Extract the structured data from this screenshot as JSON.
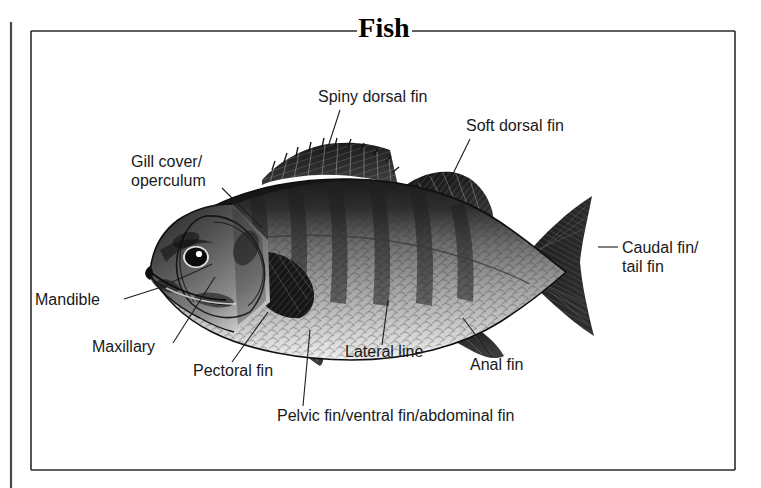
{
  "page": {
    "title": "Fish",
    "background": "#ffffff",
    "ink": "#1a1a1a"
  },
  "frame": {
    "name": "diagram-border",
    "left": 31,
    "top": 31,
    "right": 735,
    "bottom": 470,
    "title_gap_left": 357,
    "title_gap_right": 412,
    "spine_x": 11,
    "spine_top": 22,
    "spine_bottom": 488
  },
  "illustration": {
    "name": "fish-illustration",
    "subject": "perch",
    "caption": "Engraved side view of a perch showing fins, scales and head detail"
  },
  "labels": [
    {
      "id": "spiny-dorsal-fin",
      "lines": [
        "Spiny dorsal fin"
      ],
      "x": 318,
      "y": 102,
      "anchor": "start",
      "leader": [
        [
          340,
          110
        ],
        [
          327,
          150
        ]
      ]
    },
    {
      "id": "soft-dorsal-fin",
      "lines": [
        "Soft dorsal fin"
      ],
      "x": 466,
      "y": 131,
      "anchor": "start",
      "leader": [
        [
          470,
          139
        ],
        [
          447,
          186
        ]
      ]
    },
    {
      "id": "gill-cover-operculum",
      "lines": [
        "Gill cover/",
        "operculum"
      ],
      "x": 131,
      "y": 167,
      "anchor": "start",
      "leader": [
        [
          222,
          188
        ],
        [
          262,
          228
        ]
      ]
    },
    {
      "id": "caudal-fin-tail-fin",
      "lines": [
        "Caudal fin/",
        "tail fin"
      ],
      "x": 622,
      "y": 253,
      "anchor": "start",
      "leader": [
        [
          598,
          247
        ],
        [
          618,
          247
        ]
      ]
    },
    {
      "id": "mandible",
      "lines": [
        "Mandible"
      ],
      "x": 35,
      "y": 305,
      "anchor": "start",
      "leader": [
        [
          124,
          299
        ],
        [
          168,
          285
        ]
      ]
    },
    {
      "id": "maxillary",
      "lines": [
        "Maxillary"
      ],
      "x": 92,
      "y": 352,
      "anchor": "start",
      "leader": [
        [
          173,
          343
        ],
        [
          215,
          277
        ]
      ]
    },
    {
      "id": "pectoral-fin",
      "lines": [
        "Pectoral fin"
      ],
      "x": 193,
      "y": 376,
      "anchor": "start",
      "leader": [
        [
          232,
          362
        ],
        [
          268,
          312
        ]
      ]
    },
    {
      "id": "lateral-line",
      "lines": [
        "Lateral line"
      ],
      "x": 345,
      "y": 357,
      "anchor": "start",
      "leader": [
        [
          382,
          345
        ],
        [
          388,
          300
        ]
      ]
    },
    {
      "id": "anal-fin",
      "lines": [
        "Anal fin"
      ],
      "x": 470,
      "y": 370,
      "anchor": "start",
      "leader": [
        [
          492,
          357
        ],
        [
          463,
          318
        ]
      ]
    },
    {
      "id": "pelvic-ventral-abdominal-fin",
      "lines": [
        "Pelvic fin/ventral fin/abdominal fin"
      ],
      "x": 277,
      "y": 421,
      "anchor": "start",
      "leader": [
        [
          303,
          406
        ],
        [
          310,
          330
        ]
      ]
    }
  ]
}
